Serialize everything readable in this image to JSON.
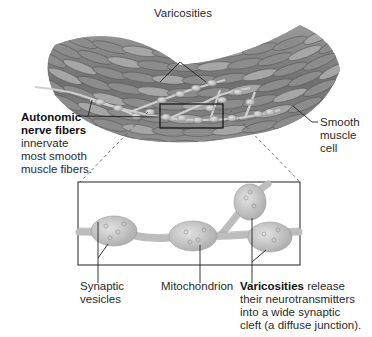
{
  "labels": {
    "varicosities_top": "Varicosities",
    "autonomic_bold_1": "Autonomic",
    "autonomic_bold_2": "nerve fibers",
    "autonomic_desc_1": "innervate",
    "autonomic_desc_2": "most smooth",
    "autonomic_desc_3": "muscle fibers.",
    "smooth_1": "Smooth",
    "smooth_2": "muscle",
    "smooth_3": "cell",
    "synaptic_1": "Synaptic",
    "synaptic_2": "vesicles",
    "mitochondrion": "Mitochondrion",
    "varic_bold": "Varicosities",
    "varic_desc_1": " release",
    "varic_desc_2": "their neurotransmitters",
    "varic_desc_3": "into a wide synaptic",
    "varic_desc_4": "cleft (a diffuse junction)."
  },
  "colors": {
    "muscle_dark": "#5a5a5a",
    "muscle_mid": "#8a8a8a",
    "muscle_light": "#b5b5b5",
    "nerve": "#c8c8c8",
    "line": "#222222"
  }
}
